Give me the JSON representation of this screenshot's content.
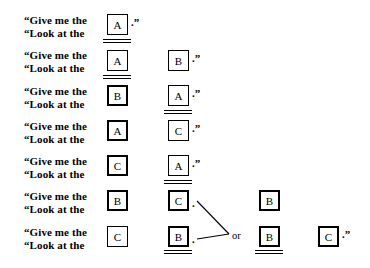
{
  "figure": {
    "prompt_line_1": "“Give me the",
    "prompt_line_2": "“Look at the",
    "terminator": ".”",
    "mid_dot": ".",
    "or_label": "or",
    "rows": [
      {
        "id": "row-1",
        "prompt_line_1": "“Give me the",
        "prompt_line_2": "“Look at the",
        "cells": [
          "A"
        ],
        "terminator": ".”"
      },
      {
        "id": "row-2",
        "prompt_line_1": "“Give me the",
        "prompt_line_2": "“Look at the",
        "cells": [
          "A",
          "B"
        ],
        "terminator": ".”"
      },
      {
        "id": "row-3",
        "prompt_line_1": "“Give me the",
        "prompt_line_2": "“Look at the",
        "cells": [
          "B",
          "A"
        ],
        "terminator": ".”"
      },
      {
        "id": "row-4",
        "prompt_line_1": "“Give me the",
        "prompt_line_2": "“Look at the",
        "cells": [
          "A",
          "C"
        ],
        "terminator": ".”"
      },
      {
        "id": "row-5",
        "prompt_line_1": "“Give me the",
        "prompt_line_2": "“Look at the",
        "cells": [
          "C",
          "A"
        ],
        "terminator": ".”"
      },
      {
        "id": "row-6",
        "prompt_line_1": "“Give me the",
        "prompt_line_2": "“Look at the",
        "cells": [
          "B",
          "C"
        ],
        "terminator": ".",
        "alternative": "B"
      },
      {
        "id": "row-7",
        "prompt_line_1": "“Give me the",
        "prompt_line_2": "“Look at the",
        "cells": [
          "C",
          "B"
        ],
        "terminator": ".",
        "alternative": "B",
        "tail_cell": "C",
        "tail_terminator": ".”"
      }
    ],
    "colors": {
      "ink": "#000000",
      "paper": "#ffffff"
    }
  }
}
